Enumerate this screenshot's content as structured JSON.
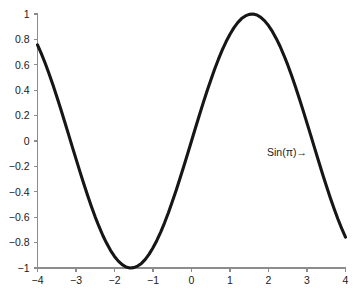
{
  "chart_data": {
    "type": "line",
    "title": "",
    "xlabel": "",
    "ylabel": "",
    "xlim": [
      -4,
      4
    ],
    "ylim": [
      -1,
      1
    ],
    "grid": false,
    "legend": null,
    "x_ticks": [
      -4,
      -3,
      -2,
      -1,
      0,
      1,
      2,
      3,
      4
    ],
    "x_tick_labels": [
      "-4",
      "-3",
      "-2",
      "-1",
      "0",
      "1",
      "2",
      "3",
      "4"
    ],
    "y_ticks": [
      -1,
      -0.8,
      -0.6,
      -0.4,
      -0.2,
      0,
      0.2,
      0.4,
      0.6,
      0.8,
      1
    ],
    "y_tick_labels": [
      "-1",
      "-0.8",
      "-0.6",
      "-0.4",
      "-0.2",
      "0",
      "0.2",
      "0.4",
      "0.6",
      "0.8",
      "1"
    ],
    "series": [
      {
        "name": "sin(x)",
        "color": "#161616",
        "linewidth": 3.1,
        "x": [
          -4,
          -3.9,
          -3.8,
          -3.7,
          -3.6,
          -3.5,
          -3.4,
          -3.3,
          -3.2,
          -3.1,
          -3,
          -2.9,
          -2.8,
          -2.7,
          -2.6,
          -2.5,
          -2.4,
          -2.3,
          -2.2,
          -2.1,
          -2,
          -1.9,
          -1.8,
          -1.7,
          -1.6,
          -1.5,
          -1.4,
          -1.3,
          -1.2,
          -1.1,
          -1,
          -0.9,
          -0.8,
          -0.7,
          -0.6,
          -0.5,
          -0.4,
          -0.3,
          -0.2,
          -0.1,
          0,
          0.1,
          0.2,
          0.3,
          0.4,
          0.5,
          0.6,
          0.7,
          0.8,
          0.9,
          1,
          1.1,
          1.2,
          1.3,
          1.4,
          1.5,
          1.6,
          1.7,
          1.8,
          1.9,
          2,
          2.1,
          2.2,
          2.3,
          2.4,
          2.5,
          2.6,
          2.7,
          2.8,
          2.9,
          3,
          3.1,
          3.2,
          3.3,
          3.4,
          3.5,
          3.6,
          3.7,
          3.8,
          3.9,
          4
        ],
        "y": [
          0.757,
          0.688,
          0.612,
          0.53,
          0.443,
          0.351,
          0.256,
          0.158,
          0.058,
          -0.042,
          -0.141,
          -0.239,
          -0.335,
          -0.427,
          -0.516,
          -0.599,
          -0.675,
          -0.746,
          -0.808,
          -0.863,
          -0.909,
          -0.946,
          -0.974,
          -0.992,
          -1.0,
          -0.997,
          -0.985,
          -0.964,
          -0.932,
          -0.891,
          -0.841,
          -0.783,
          -0.717,
          -0.644,
          -0.565,
          -0.479,
          -0.389,
          -0.296,
          -0.199,
          -0.1,
          0.0,
          0.1,
          0.199,
          0.296,
          0.389,
          0.479,
          0.565,
          0.644,
          0.717,
          0.783,
          0.841,
          0.891,
          0.932,
          0.964,
          0.985,
          0.997,
          1.0,
          0.992,
          0.974,
          0.946,
          0.909,
          0.863,
          0.808,
          0.746,
          0.675,
          0.599,
          0.516,
          0.427,
          0.335,
          0.239,
          0.141,
          0.042,
          -0.058,
          -0.158,
          -0.256,
          -0.351,
          -0.443,
          -0.53,
          -0.612,
          -0.688,
          -0.757
        ]
      }
    ],
    "annotations": [
      {
        "text": "Sin(π)→",
        "x": 2.48,
        "y": -0.115
      }
    ],
    "axis_color": "#8c8c8c",
    "background_color": "#ffffff",
    "tick_direction": "out",
    "spines": [
      "left",
      "bottom"
    ]
  }
}
